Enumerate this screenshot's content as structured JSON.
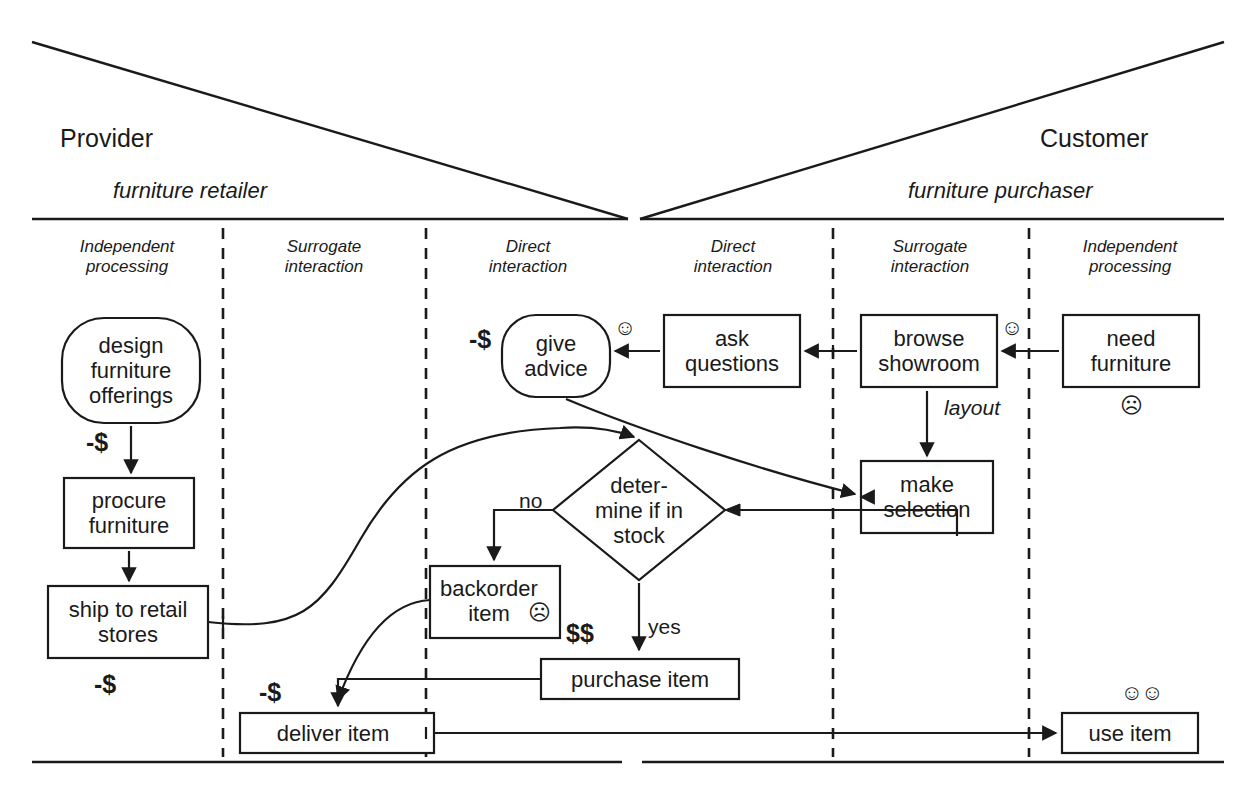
{
  "diagram": {
    "type": "service-blueprint",
    "ink_color": "#1a1a1a",
    "roles": [
      {
        "id": "provider",
        "name": "Provider",
        "subtitle": "furniture retailer"
      },
      {
        "id": "customer",
        "name": "Customer",
        "subtitle": "furniture purchaser"
      }
    ],
    "zones": [
      {
        "id": "provider-independent",
        "line1": "Independent",
        "line2": "processing"
      },
      {
        "id": "provider-surrogate",
        "line1": "Surrogate",
        "line2": "interaction"
      },
      {
        "id": "provider-direct",
        "line1": "Direct",
        "line2": "interaction"
      },
      {
        "id": "customer-direct",
        "line1": "Direct",
        "line2": "interaction"
      },
      {
        "id": "customer-surrogate",
        "line1": "Surrogate",
        "line2": "interaction"
      },
      {
        "id": "customer-independent",
        "line1": "Independent",
        "line2": "processing"
      }
    ],
    "nodes": [
      {
        "id": "design-furniture-offerings",
        "shape": "rounded",
        "lines": [
          "design",
          "furniture",
          "offerings"
        ]
      },
      {
        "id": "procure-furniture",
        "shape": "rect",
        "lines": [
          "procure",
          "furniture"
        ]
      },
      {
        "id": "ship-to-retail-stores",
        "shape": "rect",
        "lines": [
          "ship to retail",
          "stores"
        ]
      },
      {
        "id": "give-advice",
        "shape": "rounded",
        "lines": [
          "give",
          "advice"
        ]
      },
      {
        "id": "ask-questions",
        "shape": "rect",
        "lines": [
          "ask",
          "questions"
        ]
      },
      {
        "id": "browse-showroom",
        "shape": "rect",
        "lines": [
          "browse",
          "showroom"
        ]
      },
      {
        "id": "need-furniture",
        "shape": "rect",
        "lines": [
          "need",
          "furniture"
        ]
      },
      {
        "id": "make-selection",
        "shape": "rect",
        "lines": [
          "make",
          "selection"
        ]
      },
      {
        "id": "determine-if-in-stock",
        "shape": "diamond",
        "lines": [
          "deter-",
          "mine if in",
          "stock"
        ]
      },
      {
        "id": "backorder-item",
        "shape": "rect",
        "lines": [
          "backorder",
          "item"
        ]
      },
      {
        "id": "purchase-item",
        "shape": "rect",
        "lines": [
          "purchase item"
        ]
      },
      {
        "id": "deliver-item",
        "shape": "rect",
        "lines": [
          "deliver item"
        ]
      },
      {
        "id": "use-item",
        "shape": "rect",
        "lines": [
          "use item"
        ]
      }
    ],
    "cost_labels": [
      {
        "id": "cost-design-to-procure",
        "text": "-$"
      },
      {
        "id": "cost-ship-to-retail",
        "text": "-$"
      },
      {
        "id": "cost-give-advice",
        "text": "-$"
      },
      {
        "id": "cost-backorder",
        "text": "$$"
      },
      {
        "id": "cost-deliver-item",
        "text": "-$"
      }
    ],
    "edge_labels": [
      {
        "id": "edge-label-layout",
        "text": "layout",
        "style": "italic"
      },
      {
        "id": "edge-label-no",
        "text": "no",
        "style": "normal"
      },
      {
        "id": "edge-label-yes",
        "text": "yes",
        "style": "normal"
      }
    ],
    "emotions": [
      {
        "id": "emotion-give-advice",
        "glyph": "☺",
        "mood": "happy"
      },
      {
        "id": "emotion-browse-showroom",
        "glyph": "☺",
        "mood": "happy"
      },
      {
        "id": "emotion-need-furniture",
        "glyph": "☹",
        "mood": "sad"
      },
      {
        "id": "emotion-backorder-item",
        "glyph": "☹",
        "mood": "sad"
      },
      {
        "id": "emotion-use-item",
        "glyph": "☺☺",
        "mood": "very-happy"
      }
    ]
  }
}
